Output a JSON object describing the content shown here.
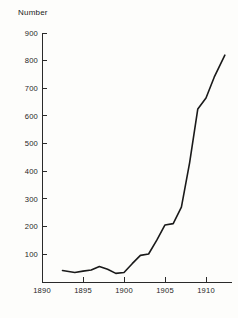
{
  "chart_data": {
    "type": "line",
    "title": "",
    "subtitle": "",
    "xlabel": "",
    "ylabel": "Number",
    "ylabel_position": "above-axis-top-left",
    "grid": false,
    "legend": false,
    "legend_position": "none",
    "xlim": [
      1890,
      1912.5
    ],
    "ylim": [
      0,
      900
    ],
    "x_ticks": [
      1890,
      1895,
      1900,
      1905,
      1910
    ],
    "x_tick_labels": [
      "1890",
      "1895",
      "1900",
      "1905",
      "1910"
    ],
    "y_ticks": [
      100,
      200,
      300,
      400,
      500,
      600,
      700,
      800,
      900
    ],
    "y_tick_labels": [
      "100",
      "200",
      "300",
      "400",
      "500",
      "600",
      "700",
      "800",
      "900"
    ],
    "series": [
      {
        "name": "Number",
        "color": "#1a1a1a",
        "x": [
          1892.5,
          1894,
          1895,
          1896,
          1897,
          1898,
          1899,
          1900,
          1901,
          1902,
          1903,
          1904,
          1905,
          1906,
          1907,
          1908,
          1909,
          1910,
          1911,
          1912.3
        ],
        "values": [
          40,
          33,
          38,
          42,
          55,
          45,
          30,
          33,
          65,
          95,
          100,
          150,
          205,
          210,
          270,
          430,
          625,
          665,
          740,
          820
        ]
      }
    ]
  },
  "axes": {
    "y_title": "Number"
  },
  "colors": {
    "background": "#fdfdfb",
    "axis": "#2a2a2a",
    "line": "#1a1a1a",
    "text": "#1f1f1f"
  }
}
